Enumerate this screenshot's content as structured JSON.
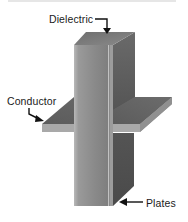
{
  "figure": {
    "type": "capacitor-structure-illustration",
    "labels": {
      "dielectric": "Dielectric",
      "conductor": "Conductor",
      "plates": "Plates"
    },
    "colors": {
      "column_front": "#8a8a8a",
      "column_front_edge": "#b5b5b5",
      "column_side": "#5e5e5e",
      "column_top": "#7a7a7a",
      "plate_top": "#6a6a6a",
      "plate_front": "#a8a8a8",
      "lower_plate": "#4f4f4f",
      "arrow": "#111111",
      "top_rule": "#e6e6e6"
    }
  }
}
